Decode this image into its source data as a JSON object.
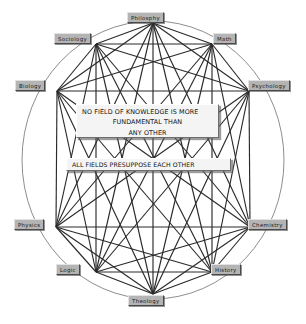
{
  "diagram": {
    "title": "No field of knowledge is more fundamental than any other",
    "type": "complete-graph-on-ellipse",
    "node_count": 10,
    "edge_style": "every node connected to every other node",
    "colors": {
      "background": "#ffffff",
      "node_fill": "#b4b4b4",
      "node_text": "#1a1a1a",
      "edge": "#2a2a2a",
      "ellipse": "#808080",
      "callout_fill": "#f4f4f4",
      "callout_text": "#111111"
    },
    "ellipse": {
      "center_x": 153,
      "center_y": 160,
      "radius_x": 131,
      "radius_y": 139
    },
    "nodes": [
      {
        "id": "philosophy",
        "label": "Philosphy",
        "hub_x": 153,
        "hub_y": 23,
        "box_x": 127,
        "box_y": 12,
        "anchor": "top"
      },
      {
        "id": "sociology",
        "label": "Sociology",
        "hub_x": 96,
        "hub_y": 44,
        "box_x": 54,
        "box_y": 33,
        "anchor": "right"
      },
      {
        "id": "math",
        "label": "Math",
        "hub_x": 212,
        "hub_y": 44,
        "box_x": 213,
        "box_y": 33,
        "anchor": "left"
      },
      {
        "id": "biology",
        "label": "Biology",
        "hub_x": 57,
        "hub_y": 91,
        "box_x": 15,
        "box_y": 80,
        "anchor": "right"
      },
      {
        "id": "psychology",
        "label": "Psychology",
        "hub_x": 249,
        "hub_y": 91,
        "box_x": 248,
        "box_y": 80,
        "anchor": "left"
      },
      {
        "id": "physics",
        "label": "Physics",
        "hub_x": 56,
        "hub_y": 227,
        "box_x": 14,
        "box_y": 219,
        "anchor": "right"
      },
      {
        "id": "chemistry",
        "label": "Chemistry",
        "hub_x": 250,
        "hub_y": 227,
        "box_x": 248,
        "box_y": 219,
        "anchor": "left"
      },
      {
        "id": "logic",
        "label": "Logic",
        "hub_x": 96,
        "hub_y": 272,
        "box_x": 56,
        "box_y": 264,
        "anchor": "right"
      },
      {
        "id": "history",
        "label": "History",
        "hub_x": 212,
        "hub_y": 272,
        "box_x": 211,
        "box_y": 264,
        "anchor": "left"
      },
      {
        "id": "theology",
        "label": "Theology",
        "hub_x": 153,
        "hub_y": 294,
        "box_x": 128,
        "box_y": 295,
        "anchor": "bottom"
      }
    ],
    "callouts": [
      {
        "id": "callout-fundamental",
        "lines": [
          "NO FIELD OF KNOWLEDGE IS MORE",
          "FUNDAMENTAL THAN",
          "ANY OTHER"
        ]
      },
      {
        "id": "callout-presuppose",
        "lines": [
          "ALL FIELDS PRESUPPOSE EACH OTHER"
        ]
      }
    ]
  }
}
